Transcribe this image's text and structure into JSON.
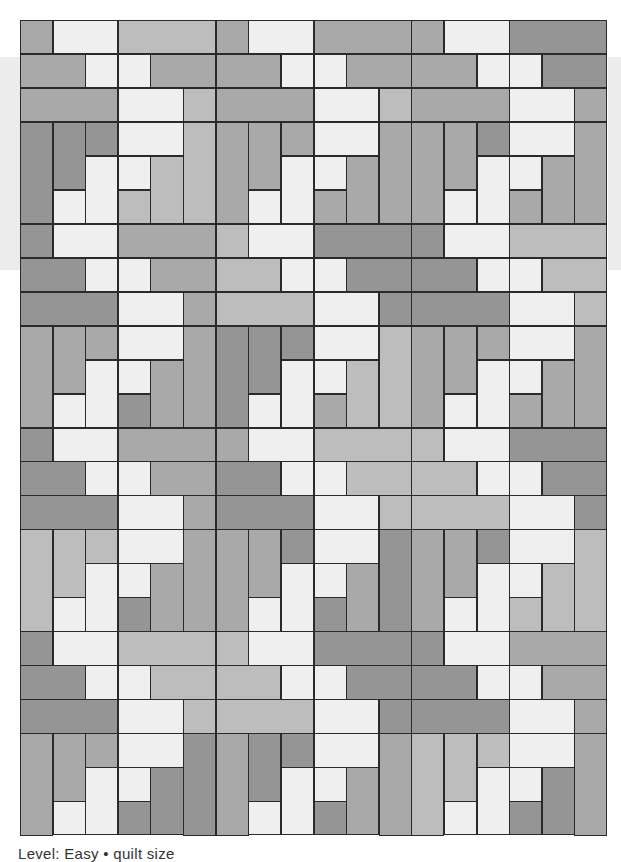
{
  "page": {
    "caption": "Level: Easy  •  quilt size"
  },
  "palette": {
    "D": "#959595",
    "M": "#a9a9a9",
    "L": "#bdbdbd",
    "W": "#efefef",
    "stroke": "#2a2a2a",
    "band": "#ececec"
  },
  "grid": {
    "cols": 18,
    "rows": 24,
    "tile_cols": 6,
    "tile_rows": 6,
    "tiles_across": 3,
    "tiles_down": 4
  },
  "tile_pieces": [
    {
      "c": 0,
      "r": 0,
      "w": 1,
      "h": 1
    },
    {
      "c": 1,
      "r": 0,
      "w": 2,
      "h": 1
    },
    {
      "c": 3,
      "r": 0,
      "w": 3,
      "h": 1
    },
    {
      "c": 0,
      "r": 1,
      "w": 2,
      "h": 1
    },
    {
      "c": 2,
      "r": 1,
      "w": 1,
      "h": 1
    },
    {
      "c": 3,
      "r": 1,
      "w": 1,
      "h": 1
    },
    {
      "c": 4,
      "r": 1,
      "w": 2,
      "h": 1
    },
    {
      "c": 0,
      "r": 2,
      "w": 3,
      "h": 1
    },
    {
      "c": 3,
      "r": 2,
      "w": 2,
      "h": 1
    },
    {
      "c": 5,
      "r": 2,
      "w": 1,
      "h": 1
    },
    {
      "c": 0,
      "r": 3,
      "w": 1,
      "h": 3
    },
    {
      "c": 1,
      "r": 3,
      "w": 1,
      "h": 2
    },
    {
      "c": 2,
      "r": 3,
      "w": 1,
      "h": 1
    },
    {
      "c": 3,
      "r": 3,
      "w": 2,
      "h": 1
    },
    {
      "c": 5,
      "r": 3,
      "w": 1,
      "h": 3
    },
    {
      "c": 1,
      "r": 5,
      "w": 1,
      "h": 1
    },
    {
      "c": 2,
      "r": 4,
      "w": 1,
      "h": 2
    },
    {
      "c": 3,
      "r": 4,
      "w": 1,
      "h": 1
    },
    {
      "c": 3,
      "r": 5,
      "w": 1,
      "h": 1
    },
    {
      "c": 4,
      "r": 4,
      "w": 1,
      "h": 2
    }
  ],
  "tiles": [
    [
      "M",
      "W",
      "L",
      "M",
      "W",
      "W",
      "M",
      "M",
      "W",
      "L",
      "D",
      "D",
      "D",
      "W",
      "L",
      "W",
      "W",
      "W",
      "L",
      "L"
    ],
    [
      "M",
      "W",
      "M",
      "M",
      "W",
      "W",
      "M",
      "M",
      "W",
      "L",
      "M",
      "M",
      "M",
      "W",
      "M",
      "W",
      "W",
      "W",
      "M",
      "M"
    ],
    [
      "M",
      "W",
      "D",
      "M",
      "W",
      "W",
      "D",
      "M",
      "W",
      "M",
      "M",
      "M",
      "D",
      "W",
      "M",
      "W",
      "W",
      "W",
      "M",
      "M"
    ],
    [
      "D",
      "W",
      "M",
      "D",
      "W",
      "W",
      "M",
      "D",
      "W",
      "M",
      "M",
      "M",
      "M",
      "W",
      "M",
      "W",
      "W",
      "W",
      "D",
      "M"
    ],
    [
      "L",
      "W",
      "D",
      "L",
      "W",
      "W",
      "D",
      "L",
      "W",
      "D",
      "D",
      "D",
      "D",
      "W",
      "L",
      "W",
      "W",
      "W",
      "M",
      "L"
    ],
    [
      "D",
      "W",
      "L",
      "D",
      "W",
      "W",
      "L",
      "D",
      "W",
      "L",
      "M",
      "M",
      "M",
      "W",
      "M",
      "W",
      "W",
      "W",
      "M",
      "M"
    ],
    [
      "D",
      "W",
      "M",
      "D",
      "W",
      "W",
      "M",
      "D",
      "W",
      "M",
      "L",
      "L",
      "L",
      "W",
      "M",
      "W",
      "W",
      "W",
      "D",
      "M"
    ],
    [
      "M",
      "W",
      "L",
      "D",
      "W",
      "W",
      "L",
      "D",
      "W",
      "L",
      "M",
      "M",
      "D",
      "W",
      "D",
      "W",
      "W",
      "W",
      "D",
      "M"
    ],
    [
      "L",
      "W",
      "D",
      "L",
      "W",
      "W",
      "D",
      "L",
      "W",
      "D",
      "M",
      "M",
      "D",
      "W",
      "L",
      "W",
      "W",
      "W",
      "L",
      "L"
    ],
    [
      "D",
      "W",
      "L",
      "D",
      "W",
      "W",
      "L",
      "D",
      "W",
      "L",
      "M",
      "M",
      "M",
      "W",
      "D",
      "W",
      "W",
      "W",
      "D",
      "D"
    ],
    [
      "L",
      "W",
      "D",
      "L",
      "W",
      "W",
      "D",
      "L",
      "W",
      "D",
      "M",
      "D",
      "D",
      "W",
      "M",
      "W",
      "W",
      "W",
      "D",
      "M"
    ],
    [
      "D",
      "W",
      "M",
      "D",
      "W",
      "W",
      "M",
      "D",
      "W",
      "M",
      "L",
      "L",
      "L",
      "W",
      "M",
      "W",
      "W",
      "W",
      "D",
      "D"
    ]
  ]
}
